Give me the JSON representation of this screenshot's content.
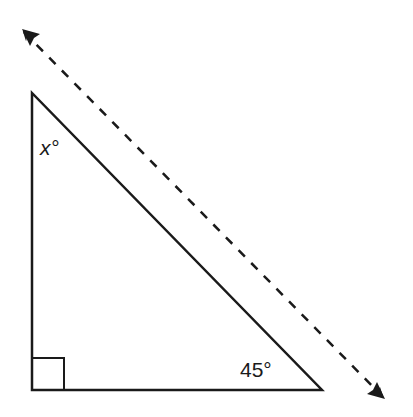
{
  "diagram": {
    "type": "right-triangle-with-parallel-line",
    "angles": {
      "top": "x°",
      "bottom_right": "45°",
      "bottom_left": "right-angle"
    },
    "colors": {
      "stroke": "#1a1a1a",
      "background": "#ffffff"
    },
    "line": {
      "style": "dashed",
      "arrows": "both-ends"
    }
  }
}
